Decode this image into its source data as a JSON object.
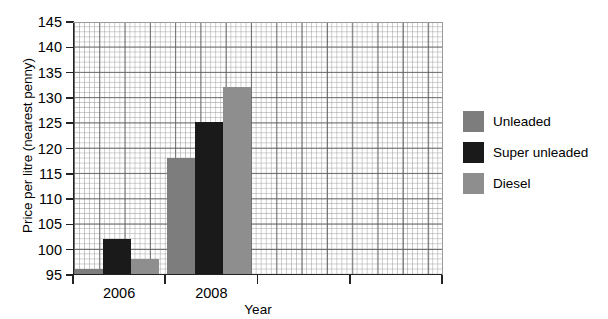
{
  "chart_data": {
    "type": "bar",
    "title": "",
    "xlabel": "Year",
    "ylabel": "Price per litre (nearest penny)",
    "categories": [
      "2006",
      "2008",
      "",
      ""
    ],
    "series": [
      {
        "name": "Unleaded",
        "color": "#7d7d7d",
        "values": [
          96,
          118,
          null,
          null
        ]
      },
      {
        "name": "Super unleaded",
        "color": "#1a1a1a",
        "values": [
          102,
          125,
          null,
          null
        ]
      },
      {
        "name": "Diesel",
        "color": "#8e8e8e",
        "values": [
          98,
          132,
          null,
          null
        ]
      }
    ],
    "ylim": [
      95,
      145
    ],
    "ytick_labels": [
      "145",
      "140",
      "135",
      "130",
      "125",
      "120",
      "115",
      "110",
      "105",
      "100",
      "95"
    ],
    "ytick_values": [
      145,
      140,
      135,
      130,
      125,
      120,
      115,
      110,
      105,
      100,
      95
    ],
    "ystep": 5,
    "grid": "graph-paper minor and major gridlines",
    "legend_position": "right"
  },
  "legend": {
    "entries": [
      {
        "label": "Unleaded",
        "color": "#7d7d7d"
      },
      {
        "label": "Super unleaded",
        "color": "#1a1a1a"
      },
      {
        "label": "Diesel",
        "color": "#8e8e8e"
      }
    ]
  }
}
